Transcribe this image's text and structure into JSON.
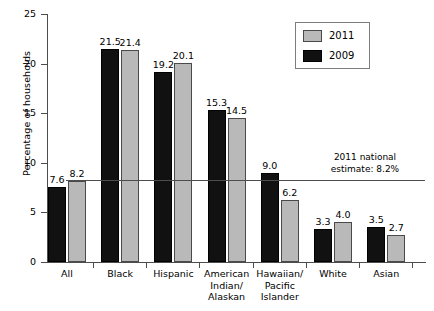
{
  "chart_data": {
    "type": "bar",
    "title": "",
    "subtitle": "",
    "xlabel": "",
    "ylabel": "Percentage of households",
    "ylim": [
      0,
      25
    ],
    "ytick_labels": [
      "0",
      "5",
      "10",
      "15",
      "20",
      "25"
    ],
    "ytick_values": [
      0,
      5,
      10,
      15,
      20,
      25
    ],
    "grid": false,
    "legend_position": "top-right",
    "categories": [
      "All",
      "Black",
      "Hispanic",
      "American Indian/ Alaskan",
      "Hawaiian/ Pacific Islander",
      "White",
      "Asian"
    ],
    "category_lines": [
      [
        "All"
      ],
      [
        "Black"
      ],
      [
        "Hispanic"
      ],
      [
        "American",
        "Indian/",
        "Alaskan"
      ],
      [
        "Hawaiian/",
        "Pacific",
        "Islander"
      ],
      [
        "White"
      ],
      [
        "Asian"
      ]
    ],
    "series": [
      {
        "name": "2009",
        "color": "#111111",
        "values": [
          7.6,
          21.5,
          19.2,
          15.3,
          9.0,
          3.3,
          3.5
        ],
        "labels": [
          "7.6",
          "21.5",
          "19.2",
          "15.3",
          "9.0",
          "3.3",
          "3.5"
        ]
      },
      {
        "name": "2011",
        "color": "#b9b9b9",
        "values": [
          8.2,
          21.4,
          20.1,
          14.5,
          6.2,
          4.0,
          2.7
        ],
        "labels": [
          "8.2",
          "21.4",
          "20.1",
          "14.5",
          "6.2",
          "4.0",
          "2.7"
        ]
      }
    ],
    "annotations": [
      {
        "name": "national-estimate",
        "line1": "2011 national",
        "line2": "estimate: 8.2%",
        "value": 8.2
      }
    ],
    "legend": [
      {
        "label": "2011",
        "color": "#b9b9b9"
      },
      {
        "label": "2009",
        "color": "#111111"
      }
    ]
  }
}
